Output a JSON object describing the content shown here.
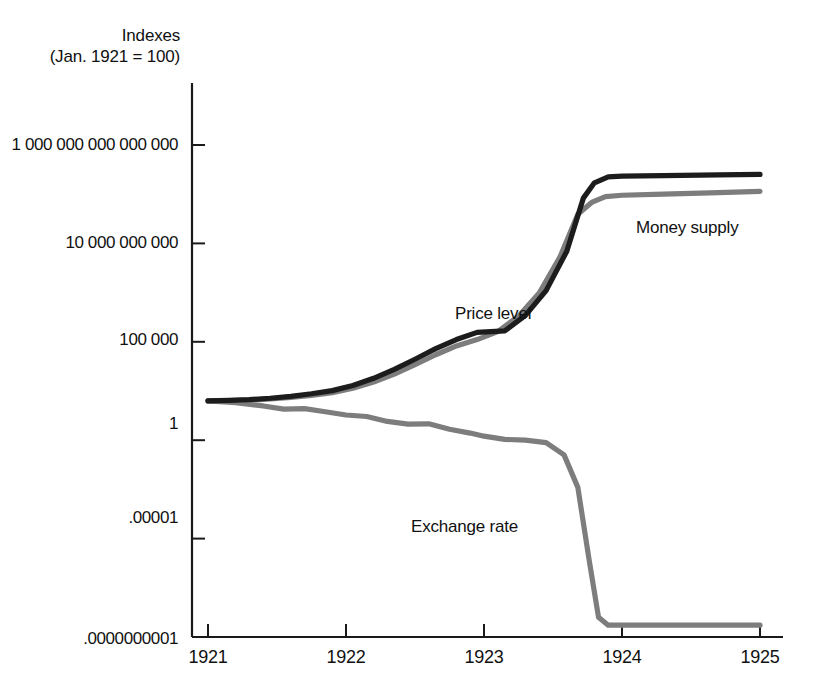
{
  "chart_data": {
    "type": "line",
    "title": "",
    "subtitle": "",
    "ylabel_line1": "Indexes",
    "ylabel_line2": "(Jan. 1921 = 100)",
    "xlabel": "",
    "grid": false,
    "legend_position": "inline-annotations",
    "yscale": "log",
    "ylim": [
      1e-10,
      1000000000000000.0
    ],
    "xlim": [
      1921,
      1925
    ],
    "ytick_labels": [
      "1 000 000 000 000 000",
      "10 000 000 000",
      "100 000",
      "1",
      ".00001",
      ".0000000001"
    ],
    "ytick_values": [
      1000000000000000.0,
      10000000000.0,
      100000.0,
      1,
      1e-05,
      1e-10
    ],
    "xtick_labels": [
      "1921",
      "1922",
      "1923",
      "1924",
      "1925"
    ],
    "xtick_values": [
      1921,
      1922,
      1923,
      1924,
      1925
    ],
    "series": [
      {
        "name": "Price level",
        "color": "#1c1c1c",
        "x": [
          1921.0,
          1921.15,
          1921.3,
          1921.45,
          1921.6,
          1921.75,
          1921.9,
          1922.05,
          1922.2,
          1922.35,
          1922.5,
          1922.65,
          1922.8,
          1922.95,
          1923.05,
          1923.15,
          1923.3,
          1923.45,
          1923.6,
          1923.72,
          1923.8,
          1923.9,
          1924.0,
          1924.3,
          1924.7,
          1925.0
        ],
        "values": [
          100,
          105,
          115,
          135,
          170,
          230,
          330,
          600,
          1400,
          4000,
          13000,
          45000,
          130000,
          300000,
          330000,
          360000,
          2200000.0,
          40000000.0,
          4000000000.0,
          2000000000000.0,
          12000000000000.0,
          24000000000000.0,
          26000000000000.0,
          28000000000000.0,
          30000000000000.0,
          32000000000000.0
        ]
      },
      {
        "name": "Money supply",
        "color": "#7d7d7d",
        "x": [
          1921.0,
          1921.15,
          1921.3,
          1921.45,
          1921.6,
          1921.75,
          1921.9,
          1922.05,
          1922.2,
          1922.35,
          1922.5,
          1922.65,
          1922.8,
          1922.95,
          1923.1,
          1923.25,
          1923.4,
          1923.55,
          1923.68,
          1923.78,
          1923.88,
          1924.0,
          1924.3,
          1924.7,
          1925.0
        ],
        "values": [
          100,
          103,
          110,
          125,
          150,
          190,
          260,
          440,
          900,
          2300,
          7000,
          22000,
          62000,
          130000,
          330000,
          2000000.0,
          30000000.0,
          2000000000.0,
          300000000000.0,
          1200000000000.0,
          2400000000000.0,
          2800000000000.0,
          3200000000000.0,
          3800000000000.0,
          4400000000000.0
        ]
      },
      {
        "name": "Exchange rate",
        "color": "#7d7d7d",
        "x": [
          1921.0,
          1921.2,
          1921.4,
          1921.55,
          1921.7,
          1921.85,
          1922.0,
          1922.15,
          1922.3,
          1922.45,
          1922.6,
          1922.75,
          1922.9,
          1923.0,
          1923.15,
          1923.3,
          1923.45,
          1923.58,
          1923.68,
          1923.76,
          1923.83,
          1923.9,
          1924.0,
          1924.4,
          1925.0
        ],
        "values": [
          100,
          80,
          55,
          38,
          40,
          28,
          19,
          16,
          9.0,
          6.5,
          6.8,
          3.6,
          2.3,
          1.6,
          1.1,
          1.0,
          0.75,
          0.18,
          0.004,
          1e-06,
          1e-09,
          4e-10,
          4e-10,
          4e-10,
          4e-10
        ]
      }
    ],
    "annotations": [
      {
        "text": "Money supply",
        "series": "Money supply"
      },
      {
        "text": "Price level",
        "series": "Price level"
      },
      {
        "text": "Exchange rate",
        "series": "Exchange rate"
      }
    ]
  },
  "axis": {
    "color": "#1a1a1a"
  }
}
